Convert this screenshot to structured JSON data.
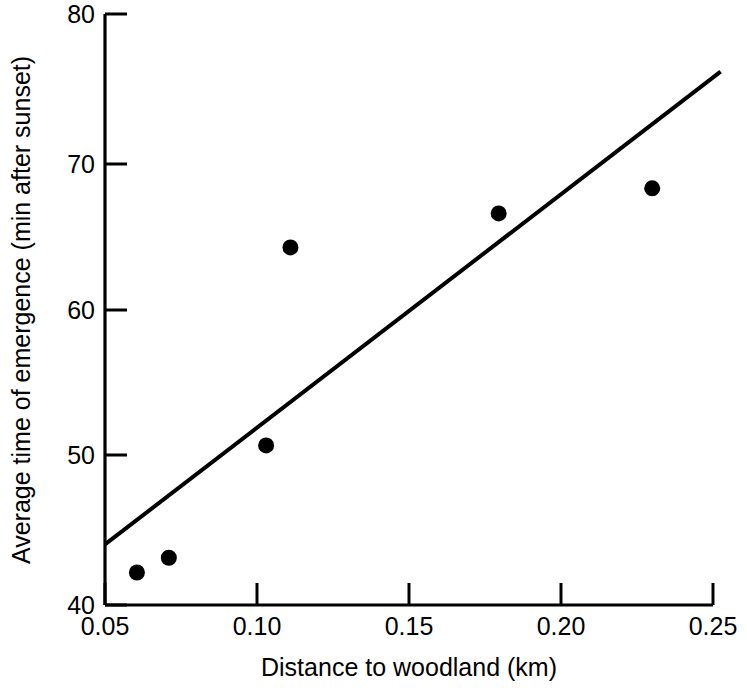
{
  "chart_data": {
    "type": "scatter",
    "title": "",
    "xlabel": "Distance to woodland (km)",
    "ylabel": "Average time of emergence (min after sunset)",
    "xlim": [
      0.05,
      0.25
    ],
    "ylim": [
      40,
      80
    ],
    "xticks": [
      "0.05",
      "0.10",
      "0.15",
      "0.20",
      "0.25"
    ],
    "xtick_values": [
      0.05,
      0.1,
      0.15,
      0.2,
      0.25
    ],
    "yticks": [
      "40",
      "50",
      "60",
      "70",
      "80"
    ],
    "ytick_values": [
      40,
      50,
      60,
      70,
      80
    ],
    "grid": false,
    "legend": "none",
    "marker_color": "#000000",
    "line_color": "#000000",
    "points": [
      {
        "x": 0.0605,
        "y": 42.2
      },
      {
        "x": 0.071,
        "y": 43.2
      },
      {
        "x": 0.103,
        "y": 50.8
      },
      {
        "x": 0.111,
        "y": 64.2
      },
      {
        "x": 0.1795,
        "y": 66.5
      },
      {
        "x": 0.23,
        "y": 68.2
      }
    ],
    "series": [
      {
        "name": "Emergence time",
        "x": [
          0.0605,
          0.071,
          0.103,
          0.111,
          0.1795,
          0.23
        ],
        "values": [
          42.2,
          43.2,
          50.8,
          64.2,
          66.5,
          68.2
        ]
      }
    ],
    "trendline": {
      "type": "line",
      "x": [
        0.05,
        0.2525
      ],
      "y": [
        44.1,
        76.1
      ]
    }
  },
  "axes": {
    "x_title": "Distance to woodland (km)",
    "y_title": "Average time of emergence (min after sunset)",
    "x_tick_labels": [
      "0.05",
      "0.10",
      "0.15",
      "0.20",
      "0.25"
    ],
    "y_tick_labels": [
      "40",
      "50",
      "60",
      "70",
      "80"
    ]
  }
}
